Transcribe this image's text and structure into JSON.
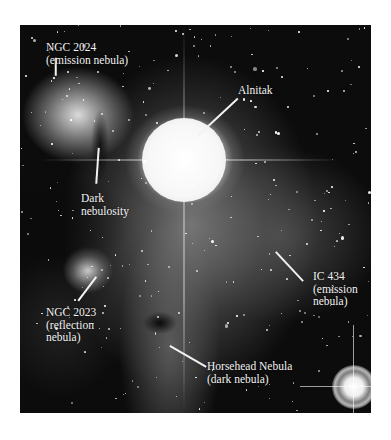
{
  "figure": {
    "labels": [
      {
        "id": "ngc2024",
        "lines": [
          "NGC 2024",
          "(emission nebula)"
        ]
      },
      {
        "id": "alnitak",
        "lines": [
          "Alnitak"
        ]
      },
      {
        "id": "dark-nebulosity",
        "lines": [
          "Dark",
          "nebulosity"
        ]
      },
      {
        "id": "ic434",
        "lines": [
          "IC 434",
          "(emission",
          "nebula)"
        ]
      },
      {
        "id": "ngc2023",
        "lines": [
          "NGC 2023",
          "(reflection",
          "nebula)"
        ]
      },
      {
        "id": "horsehead",
        "lines": [
          "Horsehead Nebula",
          "(dark nebula)"
        ]
      }
    ]
  }
}
